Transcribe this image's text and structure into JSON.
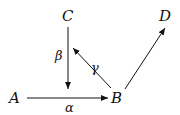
{
  "diagram": {
    "nodes": [
      {
        "id": "A",
        "label": "A"
      },
      {
        "id": "B",
        "label": "B"
      },
      {
        "id": "C",
        "label": "C"
      },
      {
        "id": "D",
        "label": "D"
      }
    ],
    "edges": [
      {
        "from": "A",
        "to": "B",
        "label": "α"
      },
      {
        "from": "C",
        "to": "A-B line",
        "label": "β"
      },
      {
        "from": "B",
        "to": "C",
        "label": "γ"
      },
      {
        "from": "B",
        "to": "D",
        "label": ""
      }
    ],
    "colors": {
      "ink": "#111111",
      "background": "#ffffff"
    }
  }
}
